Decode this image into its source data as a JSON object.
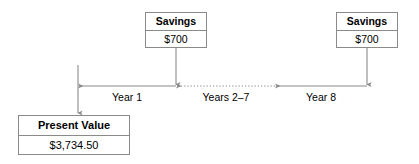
{
  "diagram": {
    "type": "timeline",
    "colors": {
      "box_border": "#8a8a8a",
      "line": "#8a8a8a",
      "text": "#000000",
      "background": "#ffffff"
    },
    "cash_flow_boxes": [
      {
        "id": "savings-1",
        "header": "Savings",
        "value": "$700",
        "period": "Year 1"
      },
      {
        "id": "savings-2",
        "header": "Savings",
        "value": "$700",
        "period": "Year 8"
      }
    ],
    "result_box": {
      "id": "present-value",
      "header": "Present Value",
      "value": "$3,734.50"
    },
    "timeline_segments": [
      {
        "id": "year-1",
        "label": "Year 1",
        "style": "solid"
      },
      {
        "id": "years-2-7",
        "label": "Years 2–7",
        "style": "dotted"
      },
      {
        "id": "year-8",
        "label": "Year 8",
        "style": "solid"
      }
    ],
    "arrows": {
      "savings_1_down": "down",
      "savings_2_down": "down",
      "present_value_down": "down",
      "timeline_direction": "left"
    }
  }
}
